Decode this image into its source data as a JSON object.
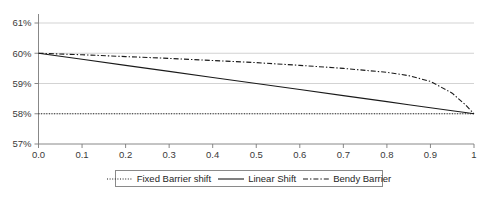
{
  "chart_data": {
    "type": "line",
    "title": "",
    "xlabel": "",
    "ylabel": "",
    "xlim": [
      0,
      1
    ],
    "ylim": [
      57,
      61
    ],
    "grid": true,
    "grid_axis": "y",
    "legend_position": "bottom-center",
    "x_tick_labels": [
      "0.0",
      "0.1",
      "0.2",
      "0.3",
      "0.4",
      "0.5",
      "0.6",
      "0.7",
      "0.8",
      "0.9",
      "1"
    ],
    "x_tick_values": [
      0,
      0.1,
      0.2,
      0.3,
      0.4,
      0.5,
      0.6,
      0.7,
      0.8,
      0.9,
      1
    ],
    "y_tick_labels": [
      "61%",
      "60%",
      "59%",
      "58%",
      "57%"
    ],
    "y_tick_values": [
      61,
      60,
      59,
      58,
      57
    ],
    "x": [
      0,
      0.1,
      0.2,
      0.3,
      0.4,
      0.5,
      0.6,
      0.7,
      0.8,
      0.85,
      0.9,
      0.95,
      0.98,
      1
    ],
    "series": [
      {
        "name": "Fixed Barrier shift",
        "style": "dotted",
        "color": "#1a1a1a",
        "values": [
          58,
          58,
          58,
          58,
          58,
          58,
          58,
          58,
          58,
          58,
          58,
          58,
          58,
          58
        ]
      },
      {
        "name": "Linear Shift",
        "style": "solid",
        "color": "#1a1a1a",
        "values": [
          60,
          59.8,
          59.6,
          59.4,
          59.2,
          59,
          58.8,
          58.6,
          58.4,
          58.3,
          58.2,
          58.1,
          58.04,
          58
        ]
      },
      {
        "name": "Bendy Barrier",
        "style": "dash-dot",
        "color": "#1a1a1a",
        "values": [
          60,
          59.95,
          59.89,
          59.83,
          59.76,
          59.69,
          59.6,
          59.5,
          59.37,
          59.26,
          59.07,
          58.68,
          58.3,
          58
        ]
      }
    ]
  },
  "legend": {
    "items": [
      {
        "label": "Fixed Barrier shift",
        "style": "dotted"
      },
      {
        "label": "Linear Shift",
        "style": "solid"
      },
      {
        "label": "Bendy Barrier",
        "style": "dash-dot"
      }
    ]
  },
  "colors": {
    "line": "#1a1a1a",
    "grid": "#c8c8c8",
    "axis": "#7a7a7a",
    "text": "#3a3a3a",
    "background": "#ffffff"
  }
}
